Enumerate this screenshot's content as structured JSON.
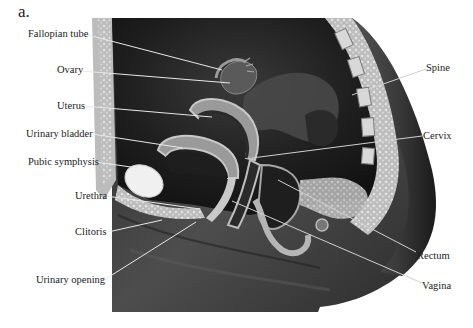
{
  "figure": {
    "panel_letter": "a.",
    "labels_left": [
      {
        "id": "fallopian-tube",
        "text": "Fallopian tube"
      },
      {
        "id": "ovary",
        "text": "Ovary"
      },
      {
        "id": "uterus",
        "text": "Uterus"
      },
      {
        "id": "urinary-bladder",
        "text": "Urinary bladder"
      },
      {
        "id": "pubic-symphysis",
        "text": "Pubic symphysis"
      },
      {
        "id": "urethra",
        "text": "Urethra"
      },
      {
        "id": "clitoris",
        "text": "Clitoris"
      },
      {
        "id": "urinary-opening",
        "text": "Urinary opening"
      }
    ],
    "labels_right": [
      {
        "id": "spine",
        "text": "Spine"
      },
      {
        "id": "cervix",
        "text": "Cervix"
      },
      {
        "id": "rectum",
        "text": "Rectum"
      },
      {
        "id": "vagina",
        "text": "Vagina"
      }
    ]
  }
}
